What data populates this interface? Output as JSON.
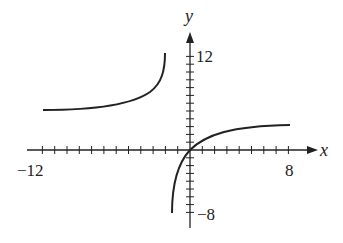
{
  "chart_data": {
    "type": "line",
    "title": "",
    "xlabel": "x",
    "ylabel": "y",
    "xlim": [
      -12,
      8
    ],
    "ylim": [
      -8,
      12
    ],
    "x_tick_labels": [
      "-12",
      "8"
    ],
    "y_tick_labels": [
      "12",
      "-8"
    ],
    "x_tick_step": 1,
    "y_tick_step": 1,
    "grid": false,
    "series": [
      {
        "name": "left branch",
        "x": [
          -12,
          -8,
          -5,
          -3,
          -2,
          -1.8
        ],
        "y": [
          5,
          5.4,
          6.5,
          8,
          10.5,
          12
        ]
      },
      {
        "name": "right branch",
        "x": [
          -1.5,
          -1,
          -0.5,
          0,
          1,
          2,
          4,
          8
        ],
        "y": [
          -8,
          -4.5,
          -1.8,
          0,
          1.7,
          2.5,
          3.2,
          3.3
        ]
      }
    ]
  },
  "labels": {
    "x_axis": "x",
    "y_axis": "y",
    "x_min": "−12",
    "x_max": "8",
    "y_max": "12",
    "y_min": "−8"
  }
}
